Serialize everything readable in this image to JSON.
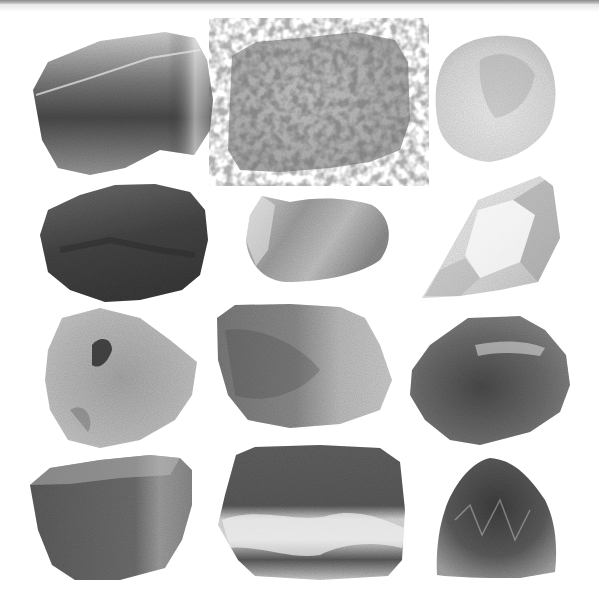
{
  "image": {
    "title": "Rock and mineral specimens",
    "layout": "4 rows x 3 columns",
    "background": "#ffffff",
    "specimens": [
      {
        "row": 1,
        "col": 1,
        "name": "dark-cleaved-mineral",
        "tone": "dark-gray translucent",
        "color_light": "#cfcfcf",
        "color_dark": "#4a4a4a"
      },
      {
        "row": 1,
        "col": 2,
        "name": "speckled-granite",
        "tone": "light-gray speckled",
        "color_light": "#d8d8d8",
        "color_dark": "#9a9a9a"
      },
      {
        "row": 1,
        "col": 3,
        "name": "pale-rounded-mineral",
        "tone": "very light gray",
        "color_light": "#eeeeee",
        "color_dark": "#bdbdbd"
      },
      {
        "row": 2,
        "col": 1,
        "name": "dark-rough-rock",
        "tone": "dark gray",
        "color_light": "#8a8a8a",
        "color_dark": "#3a3a3a"
      },
      {
        "row": 2,
        "col": 2,
        "name": "smooth-pebble",
        "tone": "medium-light gray",
        "color_light": "#cccccc",
        "color_dark": "#7e7e7e"
      },
      {
        "row": 2,
        "col": 3,
        "name": "quartz-crystal",
        "tone": "clear/white",
        "color_light": "#f7f7f7",
        "color_dark": "#a8a8a8"
      },
      {
        "row": 3,
        "col": 1,
        "name": "layered-pale-mineral",
        "tone": "light gray fibrous",
        "color_light": "#d6d6d6",
        "color_dark": "#7a7a7a"
      },
      {
        "row": 3,
        "col": 2,
        "name": "mottled-block",
        "tone": "medium gray",
        "color_light": "#cdcdcd",
        "color_dark": "#6a6a6a"
      },
      {
        "row": 3,
        "col": 3,
        "name": "dark-veined-rock",
        "tone": "dark gray with pale vein",
        "color_light": "#a8a8a8",
        "color_dark": "#4f4f4f"
      },
      {
        "row": 4,
        "col": 1,
        "name": "angular-slab",
        "tone": "medium-dark gray",
        "color_light": "#b5b5b5",
        "color_dark": "#5a5a5a"
      },
      {
        "row": 4,
        "col": 2,
        "name": "banded-marble",
        "tone": "dark gray with white bands",
        "color_light": "#e2e2e2",
        "color_dark": "#4a4a4a"
      },
      {
        "row": 4,
        "col": 3,
        "name": "crystalline-cluster",
        "tone": "dark gray crystalline",
        "color_light": "#b8b8b8",
        "color_dark": "#444444"
      }
    ]
  }
}
